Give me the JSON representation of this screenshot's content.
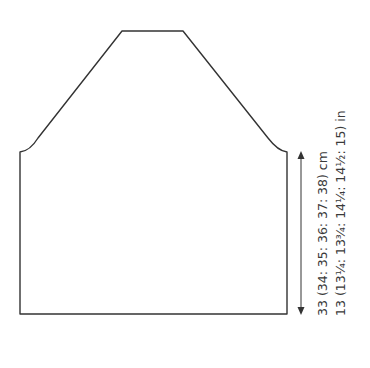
{
  "diagram": {
    "type": "knitting-schematic",
    "piece": "garment piece with raglan/sloped shoulders",
    "colors": {
      "outline": "#333333",
      "text": "#3a3a3a",
      "background": "#ffffff"
    },
    "measurements": {
      "height_cm": "33 (34: 35: 36: 37: 38) cm",
      "height_in": "13 (13¼: 13¾: 14¼: 14½: 15) in"
    },
    "arrow": {
      "icon": "double-headed-vertical-arrow"
    }
  }
}
